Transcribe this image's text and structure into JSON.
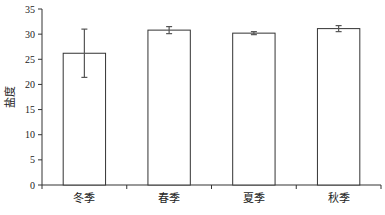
{
  "chart_data": {
    "type": "bar",
    "title": "",
    "xlabel": "",
    "ylabel": "盐度",
    "categories": [
      "冬季",
      "春季",
      "夏季",
      "秋季"
    ],
    "values": [
      26.2,
      30.8,
      30.2,
      31.1
    ],
    "errors": [
      4.8,
      0.7,
      0.3,
      0.6
    ],
    "ylim": [
      0,
      35
    ],
    "yticks": [
      0,
      5,
      10,
      15,
      20,
      25,
      30,
      35
    ],
    "grid": false,
    "legend": null,
    "bar_fill": "#ffffff",
    "bar_edge": "#333333",
    "error_bar_color": "#555555"
  }
}
